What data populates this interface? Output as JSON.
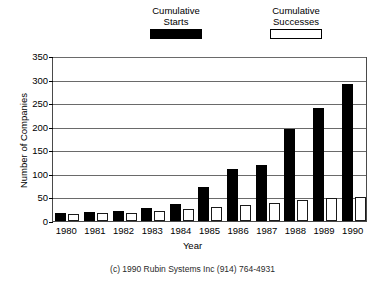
{
  "chart_data": {
    "type": "bar",
    "title": "",
    "xlabel": "Year",
    "ylabel": "Number of Companies",
    "categories": [
      "1980",
      "1981",
      "1982",
      "1983",
      "1984",
      "1985",
      "1986",
      "1987",
      "1988",
      "1989",
      "1990"
    ],
    "series": [
      {
        "name": "Cumulative Starts",
        "color": "#000000",
        "values": [
          17,
          19,
          22,
          28,
          36,
          72,
          110,
          118,
          195,
          240,
          290
        ]
      },
      {
        "name": "Cumulative Successes",
        "color": "#ffffff",
        "values": [
          14,
          16,
          18,
          22,
          25,
          30,
          34,
          38,
          44,
          48,
          52
        ]
      }
    ],
    "ylim": [
      0,
      350
    ],
    "yticks": [
      0,
      50,
      100,
      150,
      200,
      250,
      300,
      350
    ],
    "ytick_labels": [
      "0",
      "50",
      "100",
      "150",
      "200",
      "250",
      "300",
      "350"
    ],
    "grid": true,
    "legend_position": "top-center"
  },
  "legend": {
    "entries": [
      {
        "line1": "Cumulative",
        "line2": "Starts",
        "swatch": "filled-black-rect"
      },
      {
        "line1": "Cumulative",
        "line2": "Successes",
        "swatch": "open-white-rect"
      }
    ]
  },
  "caption": {
    "text": "(c) 1990 Rubin Systems Inc (914) 764-4931"
  }
}
